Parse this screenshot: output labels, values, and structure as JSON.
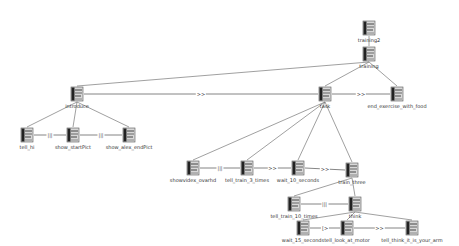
{
  "diagram": {
    "nodes": [
      {
        "id": "training2",
        "label": "training2",
        "x": 362,
        "y": 20
      },
      {
        "id": "training",
        "label": "training",
        "x": 362,
        "y": 46
      },
      {
        "id": "introduce",
        "label": "introduce",
        "x": 70,
        "y": 86
      },
      {
        "id": "task",
        "label": "task",
        "x": 318,
        "y": 86
      },
      {
        "id": "end_exercise_with_food",
        "label": "end_exercise_with_food",
        "x": 390,
        "y": 86
      },
      {
        "id": "tell_hi",
        "label": "tell_hi",
        "x": 20,
        "y": 127
      },
      {
        "id": "show_startPict",
        "label": "show_startPict",
        "x": 66,
        "y": 127
      },
      {
        "id": "show_alex_endPict",
        "label": "show_alex_endPict",
        "x": 122,
        "y": 127
      },
      {
        "id": "show_nice_overhd",
        "label": "showvidex_ovarhd",
        "x": 186,
        "y": 160
      },
      {
        "id": "tell_train_3_times",
        "label": "tell_train_3_times",
        "x": 240,
        "y": 160
      },
      {
        "id": "wait_10_seconds",
        "label": "wait_10_seconds",
        "x": 291,
        "y": 160
      },
      {
        "id": "train_three",
        "label": "train_three",
        "x": 345,
        "y": 162
      },
      {
        "id": "tell_train_10_times",
        "label": "tell_train_10_times",
        "x": 287,
        "y": 196
      },
      {
        "id": "think",
        "label": "think",
        "x": 348,
        "y": 196
      },
      {
        "id": "wait_15_seconds",
        "label": "wait_15_seconds",
        "x": 296,
        "y": 220
      },
      {
        "id": "tell_look_at_motor",
        "label": "tell_look_at_motor",
        "x": 340,
        "y": 220
      },
      {
        "id": "tell_think_it_is_your_arm",
        "label": "tell_think_it_is_your_arm",
        "x": 405,
        "y": 220
      }
    ],
    "hierarchy_edges": [
      [
        "training2",
        "training"
      ],
      [
        "training",
        "introduce"
      ],
      [
        "training",
        "task"
      ],
      [
        "training",
        "end_exercise_with_food"
      ],
      [
        "introduce",
        "tell_hi"
      ],
      [
        "introduce",
        "show_startPict"
      ],
      [
        "introduce",
        "show_alex_endPict"
      ],
      [
        "task",
        "show_nice_overhd"
      ],
      [
        "task",
        "tell_train_3_times"
      ],
      [
        "task",
        "wait_10_seconds"
      ],
      [
        "task",
        "train_three"
      ],
      [
        "train_three",
        "tell_train_10_times"
      ],
      [
        "train_three",
        "think"
      ],
      [
        "think",
        "wait_15_seconds"
      ],
      [
        "think",
        "tell_look_at_motor"
      ],
      [
        "think",
        "tell_think_it_is_your_arm"
      ]
    ],
    "sequence_edges": [
      {
        "from": "introduce",
        "to": "task",
        "label": ">>"
      },
      {
        "from": "task",
        "to": "end_exercise_with_food",
        "label": ">>"
      },
      {
        "from": "tell_hi",
        "to": "show_startPict",
        "label": "|||"
      },
      {
        "from": "show_startPict",
        "to": "show_alex_endPict",
        "label": "|||"
      },
      {
        "from": "show_nice_overhd",
        "to": "tell_train_3_times",
        "label": "|||"
      },
      {
        "from": "tell_train_3_times",
        "to": "wait_10_seconds",
        "label": ">>"
      },
      {
        "from": "wait_10_seconds",
        "to": "train_three",
        "label": ">>"
      },
      {
        "from": "tell_train_10_times",
        "to": "think",
        "label": "|||"
      },
      {
        "from": "wait_15_seconds",
        "to": "tell_look_at_motor",
        "label": "[>"
      },
      {
        "from": "tell_look_at_motor",
        "to": "tell_think_it_is_your_arm",
        "label": ">>"
      }
    ]
  }
}
